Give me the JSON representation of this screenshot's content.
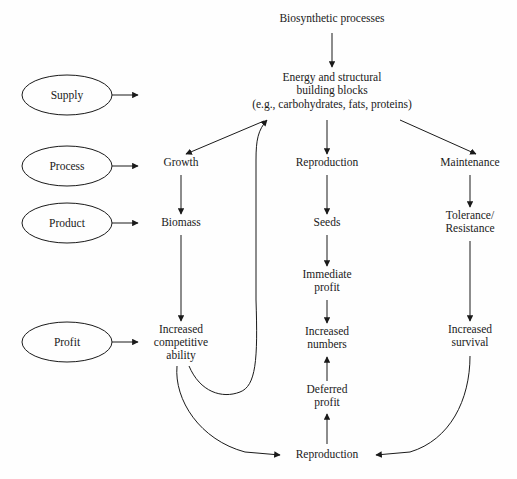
{
  "diagram": {
    "title_node": "Biosynthetic processes",
    "canvas": {
      "width": 517,
      "height": 479,
      "background": "#fefefe",
      "stroke": "#1a1a1a"
    },
    "role_ellipses": [
      {
        "id": "supply",
        "label": "Supply",
        "cx": 67,
        "cy": 95,
        "rx": 45,
        "ry": 20
      },
      {
        "id": "process",
        "label": "Process",
        "cx": 67,
        "cy": 166,
        "rx": 45,
        "ry": 20
      },
      {
        "id": "product",
        "label": "Product",
        "cx": 67,
        "cy": 223,
        "rx": 45,
        "ry": 20
      },
      {
        "id": "profit",
        "label": "Profit",
        "cx": 67,
        "cy": 342,
        "rx": 45,
        "ry": 20
      }
    ],
    "nodes": {
      "biosynthetic": {
        "label": "Biosynthetic processes",
        "x": 332,
        "y": 22
      },
      "energy_line1": {
        "label": "Energy and structural",
        "x": 332,
        "y": 81
      },
      "energy_line2": {
        "label": "building blocks",
        "x": 332,
        "y": 94
      },
      "energy_line3": {
        "label": "(e.g., carbohydrates, fats, proteins)",
        "x": 332,
        "y": 108
      },
      "growth": {
        "label": "Growth",
        "x": 181,
        "y": 166
      },
      "biomass": {
        "label": "Biomass",
        "x": 181,
        "y": 226
      },
      "increased_competitive_1": {
        "label": "Increased",
        "x": 181,
        "y": 333
      },
      "increased_competitive_2": {
        "label": "competitive",
        "x": 181,
        "y": 346
      },
      "increased_competitive_3": {
        "label": "ability",
        "x": 181,
        "y": 359
      },
      "reproduction_top": {
        "label": "Reproduction",
        "x": 327,
        "y": 166
      },
      "seeds": {
        "label": "Seeds",
        "x": 327,
        "y": 226
      },
      "immediate_1": {
        "label": "Immediate",
        "x": 327,
        "y": 278
      },
      "immediate_2": {
        "label": "profit",
        "x": 327,
        "y": 291
      },
      "increased_numbers_1": {
        "label": "Increased",
        "x": 327,
        "y": 335
      },
      "increased_numbers_2": {
        "label": "numbers",
        "x": 327,
        "y": 348
      },
      "deferred_1": {
        "label": "Deferred",
        "x": 327,
        "y": 393
      },
      "deferred_2": {
        "label": "profit",
        "x": 327,
        "y": 406
      },
      "maintenance": {
        "label": "Maintenance",
        "x": 470,
        "y": 166
      },
      "tolerance_1": {
        "label": "Tolerance/",
        "x": 470,
        "y": 219
      },
      "tolerance_2": {
        "label": "Resistance",
        "x": 470,
        "y": 232
      },
      "increased_survival_1": {
        "label": "Increased",
        "x": 470,
        "y": 333
      },
      "increased_survival_2": {
        "label": "survival",
        "x": 470,
        "y": 346
      },
      "reproduction_bottom": {
        "label": "Reproduction",
        "x": 327,
        "y": 458
      }
    },
    "edge_list": [
      "biosynthetic-to-energy",
      "energy-to-growth",
      "energy-to-reproduction",
      "energy-to-maintenance",
      "growth-to-biomass",
      "biomass-to-increased-competitive",
      "reproduction-to-seeds",
      "seeds-to-immediate-profit",
      "immediate-profit-to-increased-numbers",
      "deferred-profit-to-increased-numbers",
      "maintenance-to-tolerance",
      "tolerance-to-increased-survival",
      "competitive-ability-to-reproduction-bottom",
      "competitive-ability-feedback-to-energy",
      "increased-survival-to-reproduction-bottom",
      "reproduction-bottom-to-deferred-profit"
    ]
  }
}
